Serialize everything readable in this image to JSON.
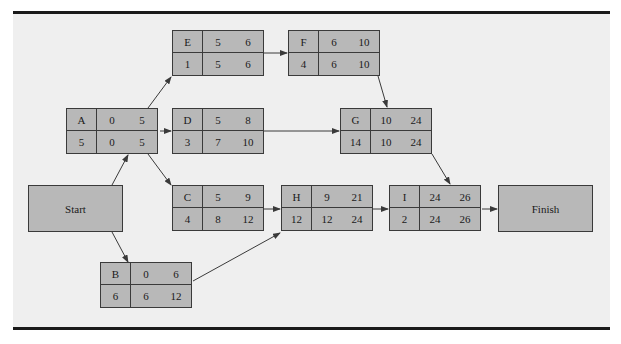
{
  "diagram": {
    "type": "project-network-critical-path",
    "cell_layout": [
      "activity",
      "earliest_start",
      "earliest_finish",
      "duration",
      "latest_start",
      "latest_finish"
    ],
    "terminals": {
      "start": {
        "label": "Start"
      },
      "finish": {
        "label": "Finish"
      }
    },
    "nodes": {
      "A": {
        "activity": "A",
        "es": "0",
        "ef": "5",
        "dur": "5",
        "ls": "0",
        "lf": "5"
      },
      "B": {
        "activity": "B",
        "es": "0",
        "ef": "6",
        "dur": "6",
        "ls": "6",
        "lf": "12"
      },
      "C": {
        "activity": "C",
        "es": "5",
        "ef": "9",
        "dur": "4",
        "ls": "8",
        "lf": "12"
      },
      "D": {
        "activity": "D",
        "es": "5",
        "ef": "8",
        "dur": "3",
        "ls": "7",
        "lf": "10"
      },
      "E": {
        "activity": "E",
        "es": "5",
        "ef": "6",
        "dur": "1",
        "ls": "5",
        "lf": "6"
      },
      "F": {
        "activity": "F",
        "es": "6",
        "ef": "10",
        "dur": "4",
        "ls": "6",
        "lf": "10"
      },
      "G": {
        "activity": "G",
        "es": "10",
        "ef": "24",
        "dur": "14",
        "ls": "10",
        "lf": "24"
      },
      "H": {
        "activity": "H",
        "es": "9",
        "ef": "21",
        "dur": "12",
        "ls": "12",
        "lf": "24"
      },
      "I": {
        "activity": "I",
        "es": "24",
        "ef": "26",
        "dur": "2",
        "ls": "24",
        "lf": "26"
      }
    },
    "edges": [
      [
        "Start",
        "A"
      ],
      [
        "Start",
        "B"
      ],
      [
        "A",
        "E"
      ],
      [
        "A",
        "D"
      ],
      [
        "A",
        "C"
      ],
      [
        "E",
        "F"
      ],
      [
        "F",
        "G"
      ],
      [
        "D",
        "G"
      ],
      [
        "C",
        "H"
      ],
      [
        "B",
        "H"
      ],
      [
        "G",
        "I"
      ],
      [
        "H",
        "I"
      ],
      [
        "I",
        "Finish"
      ]
    ],
    "colors": {
      "node_fill": "#b8b8b8",
      "background": "#efefef",
      "line": "#3a3a3a"
    }
  }
}
